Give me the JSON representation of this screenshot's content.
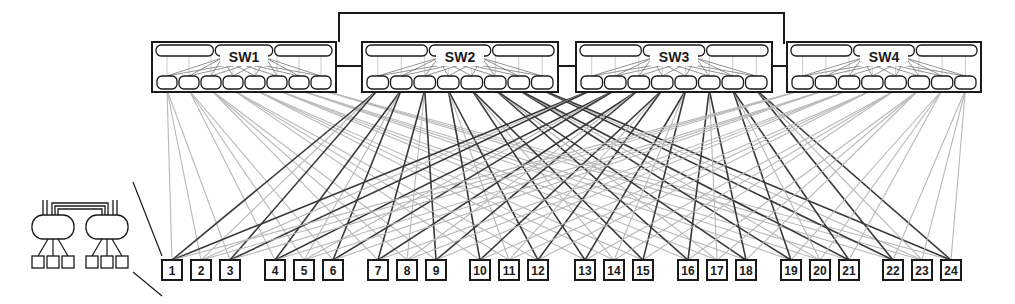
{
  "diagram": {
    "type": "network-topology",
    "colors": {
      "stroke": "#1a1a1a",
      "link_dark": "#3a3a3a",
      "link_light": "#b8b8b8",
      "background": "#ffffff"
    },
    "switches": [
      {
        "id": "SW1",
        "label": "SW1",
        "x": 152,
        "w": 184
      },
      {
        "id": "SW2",
        "label": "SW2",
        "x": 362,
        "w": 196
      },
      {
        "id": "SW3",
        "label": "SW3",
        "x": 576,
        "w": 196
      },
      {
        "id": "SW4",
        "label": "SW4",
        "x": 787,
        "w": 194
      }
    ],
    "switch_inner": {
      "top_modules": 3,
      "bottom_ports": 8
    },
    "interconnect": "SW1-SW2, SW2-SW3, SW3-SW4 adjacent links plus top bus SW1-SW4",
    "nodes": [
      {
        "label": "1"
      },
      {
        "label": "2"
      },
      {
        "label": "3"
      },
      {
        "label": "4"
      },
      {
        "label": "5"
      },
      {
        "label": "6"
      },
      {
        "label": "7"
      },
      {
        "label": "8"
      },
      {
        "label": "9"
      },
      {
        "label": "10"
      },
      {
        "label": "11"
      },
      {
        "label": "12"
      },
      {
        "label": "13"
      },
      {
        "label": "14"
      },
      {
        "label": "15"
      },
      {
        "label": "16"
      },
      {
        "label": "17"
      },
      {
        "label": "18"
      },
      {
        "label": "19"
      },
      {
        "label": "20"
      },
      {
        "label": "21"
      },
      {
        "label": "22"
      },
      {
        "label": "23"
      },
      {
        "label": "24"
      }
    ],
    "node_groups": 8,
    "inset": {
      "description": "detail view: two routers with three-node fanout each",
      "routers": 2,
      "nodes_per_router": 3
    }
  }
}
